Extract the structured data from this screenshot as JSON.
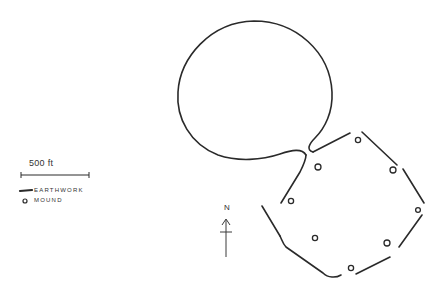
{
  "scale": {
    "label": "500 ft"
  },
  "legend": {
    "items": [
      {
        "symbol": "line",
        "label": "EARTHWORK"
      },
      {
        "symbol": "circle",
        "label": "MOUND"
      }
    ]
  },
  "north_arrow": {
    "label": "N"
  },
  "colors": {
    "ink": "#2a2a2a",
    "background": "#ffffff"
  },
  "features": {
    "great_circle": {
      "type": "earthwork",
      "shape": "circle"
    },
    "octagon": {
      "type": "earthwork",
      "shape": "octagon",
      "mound_count": 8
    }
  }
}
